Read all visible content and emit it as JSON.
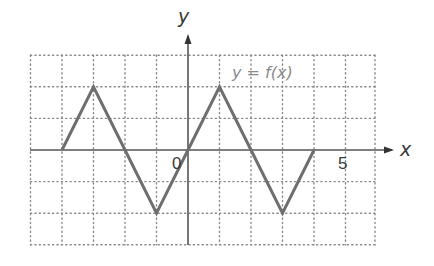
{
  "chart_data": {
    "type": "line",
    "title": "",
    "xlabel": "x",
    "ylabel": "y",
    "function_label": "y = f(x)",
    "origin_label": "0",
    "tick_labels": [
      {
        "axis": "x",
        "value": 5,
        "text": "5"
      }
    ],
    "xlim": [
      -5,
      6
    ],
    "ylim": [
      -3,
      3
    ],
    "grid": true,
    "grid_style": "dotted",
    "series": [
      {
        "name": "y = f(x)",
        "x": [
          -4,
          -3,
          -2,
          -1,
          0,
          1,
          2,
          3,
          4
        ],
        "y": [
          0,
          2,
          0,
          -2,
          0,
          2,
          0,
          -2,
          0
        ]
      }
    ],
    "colors": {
      "curve": "#6e6e6e",
      "axes": "#555555",
      "grid": "#8a8a8a",
      "function_label": "#8a8a8a"
    }
  },
  "labels": {
    "x_axis": "x",
    "y_axis": "y",
    "function": "y = f(x)",
    "origin": "0",
    "tick_5": "5"
  }
}
